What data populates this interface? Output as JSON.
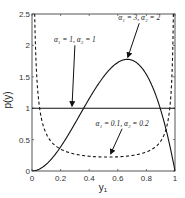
{
  "chart_data": {
    "type": "line",
    "title": "",
    "xlabel": "y₁",
    "ylabel": "p(y)",
    "xlim": [
      0,
      1
    ],
    "ylim": [
      0,
      2.5
    ],
    "grid": false,
    "legend": "none (inline annotations with arrows)",
    "x_ticks": [
      "0",
      "0.2",
      "0.4",
      "0.6",
      "0.8",
      "1"
    ],
    "y_ticks": [
      "0",
      "0.5",
      "1",
      "1.5",
      "2",
      "2.5"
    ],
    "series": [
      {
        "name": "α₁ = 1, α₂ = 1",
        "style": "solid",
        "alpha1": 1,
        "alpha2": 1,
        "x": [
          0,
          0.2,
          0.4,
          0.6,
          0.8,
          1
        ],
        "values": [
          1,
          1,
          1,
          1,
          1,
          1
        ]
      },
      {
        "name": "α₁ = 3, α₂ = 2",
        "style": "solid",
        "alpha1": 3,
        "alpha2": 2,
        "x": [
          0,
          0.1,
          0.2,
          0.3,
          0.4,
          0.5,
          0.6,
          0.667,
          0.7,
          0.8,
          0.9,
          1
        ],
        "values": [
          0,
          0.108,
          0.384,
          0.756,
          1.152,
          1.5,
          1.728,
          1.778,
          1.764,
          1.536,
          0.972,
          0
        ]
      },
      {
        "name": "α₁ = 0.1, α₂ = 0.2",
        "style": "dashed",
        "alpha1": 0.1,
        "alpha2": 0.2,
        "x": [
          0.02,
          0.05,
          0.1,
          0.2,
          0.3,
          0.4,
          0.5,
          0.6,
          0.7,
          0.8,
          0.9,
          0.95,
          0.98
        ],
        "values": [
          2.5,
          1.0,
          0.58,
          0.36,
          0.29,
          0.25,
          0.24,
          0.25,
          0.28,
          0.35,
          0.55,
          0.85,
          2.5
        ]
      }
    ],
    "annotations": [
      {
        "text": "α₁ = 1, α₂ = 1",
        "x": 0.3,
        "y": 2.05,
        "arrow_to": [
          0.28,
          1.0
        ]
      },
      {
        "text": "α₁ = 3, α₂ = 2",
        "x": 0.75,
        "y": 2.4,
        "arrow_to": [
          0.67,
          1.78
        ]
      },
      {
        "text": "α₁ = 0.1, α₂ = 0.2",
        "x": 0.63,
        "y": 0.72,
        "arrow_to": [
          0.55,
          0.24
        ]
      }
    ]
  }
}
